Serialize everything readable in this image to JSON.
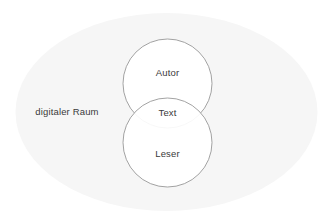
{
  "canvas": {
    "width": 333,
    "height": 224,
    "background_color": "#ffffff"
  },
  "chart_data": {
    "type": "venn",
    "title": "",
    "language": "de",
    "universe": {
      "name": "digitaler-raum",
      "label": "digitaler Raum",
      "shape": "ellipse",
      "fill_color": "#f6f6f6",
      "stroke_color": "none",
      "cx": 166.5,
      "cy": 112,
      "rx": 151,
      "ry": 99,
      "label_x": 67,
      "label_y": 112
    },
    "sets": [
      {
        "name": "autor",
        "label": "Autor",
        "shape": "circle",
        "cx": 167.5,
        "cy": 83.5,
        "r": 44.5,
        "fill_color": "#ffffff",
        "stroke_color": "#8c8c8c",
        "label_x": 167.5,
        "label_y": 73
      },
      {
        "name": "leser",
        "label": "Leser",
        "shape": "circle",
        "cx": 167.5,
        "cy": 142.5,
        "r": 44.5,
        "fill_color": "#ffffff",
        "stroke_color": "#8c8c8c",
        "label_x": 167.5,
        "label_y": 154
      }
    ],
    "intersections": [
      {
        "name": "text",
        "label": "Text",
        "of": [
          "autor",
          "leser"
        ],
        "label_x": 167.5,
        "label_y": 113
      }
    ],
    "colors": {
      "universe_fill": "#f6f6f6",
      "set_fill": "#ffffff",
      "set_stroke": "#8c8c8c",
      "text": "#3a3a3a",
      "background": "#ffffff"
    },
    "stroke_width": 0.8,
    "font_size_px": 9.5
  }
}
